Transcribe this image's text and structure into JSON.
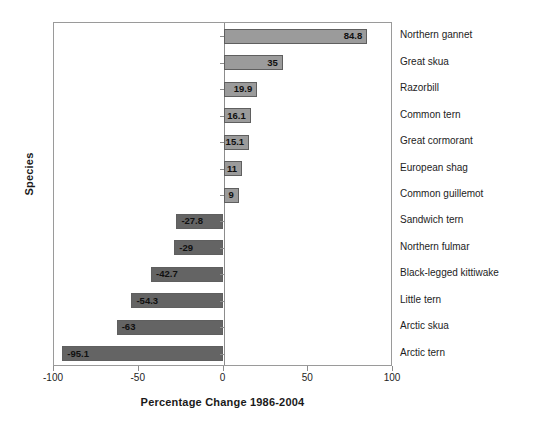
{
  "chart_data": {
    "type": "bar",
    "orientation": "horizontal",
    "title": "",
    "xlabel": "Percentage Change 1986-2004",
    "ylabel": "Species",
    "xlim": [
      -100,
      100
    ],
    "xticks": [
      -100,
      -50,
      0,
      50,
      100
    ],
    "xtick_labels": [
      "-100",
      "-50",
      "0",
      "50",
      "100"
    ],
    "grid": false,
    "legend": null,
    "categories": [
      "Northern gannet",
      "Great skua",
      "Razorbill",
      "Common tern",
      "Great cormorant",
      "European shag",
      "Common guillemot",
      "Sandwich tern",
      "Northern fulmar",
      "Black-legged kittiwake",
      "Little tern",
      "Arctic skua",
      "Arctic tern"
    ],
    "values": [
      84.8,
      35,
      19.9,
      16.1,
      15.1,
      11,
      9,
      -27.8,
      -29,
      -42.7,
      -54.3,
      -63,
      -95.1
    ],
    "value_labels": [
      "84.8",
      "35",
      "19.9",
      "16.1",
      "15.1",
      "11",
      "9",
      "-27.8",
      "-29",
      "-42.7",
      "-54.3",
      "-63",
      "-95.1"
    ],
    "colors": {
      "positive_bar": "#9b9b9b",
      "negative_bar": "#646464",
      "bar_border": "#5f5f5f",
      "axis": "#8c8c8c",
      "text": "#1d1d1d"
    }
  }
}
